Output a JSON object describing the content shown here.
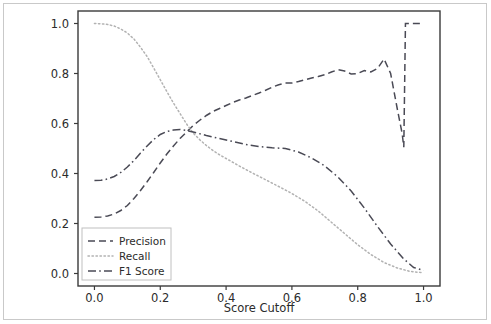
{
  "chart_data": {
    "type": "line",
    "title": "",
    "xlabel": "Score Cutoff",
    "ylabel": "",
    "xlim": [
      -0.05,
      1.05
    ],
    "ylim": [
      -0.05,
      1.05
    ],
    "grid": false,
    "legend_position": "lower left",
    "xticks": [
      0.0,
      0.2,
      0.4,
      0.6,
      0.8,
      1.0
    ],
    "xtick_labels": [
      "0.0",
      "0.2",
      "0.4",
      "0.6",
      "0.8",
      "1.0"
    ],
    "yticks": [
      0.0,
      0.2,
      0.4,
      0.6,
      0.8,
      1.0
    ],
    "ytick_labels": [
      "0.0",
      "0.2",
      "0.4",
      "0.6",
      "0.8",
      "1.0"
    ],
    "series": [
      {
        "name": "Precision",
        "style": "dashed",
        "color": "#4a4a55",
        "x": [
          0.0,
          0.02,
          0.04,
          0.06,
          0.08,
          0.1,
          0.12,
          0.14,
          0.16,
          0.18,
          0.2,
          0.22,
          0.24,
          0.26,
          0.28,
          0.3,
          0.32,
          0.34,
          0.36,
          0.38,
          0.4,
          0.42,
          0.44,
          0.46,
          0.48,
          0.5,
          0.52,
          0.54,
          0.56,
          0.58,
          0.6,
          0.62,
          0.64,
          0.66,
          0.68,
          0.7,
          0.72,
          0.74,
          0.76,
          0.78,
          0.8,
          0.82,
          0.84,
          0.86,
          0.88,
          0.9,
          0.92,
          0.935,
          0.94,
          0.945,
          0.95,
          0.96,
          0.98,
          1.0
        ],
        "y": [
          0.225,
          0.226,
          0.23,
          0.238,
          0.252,
          0.272,
          0.3,
          0.332,
          0.367,
          0.404,
          0.442,
          0.478,
          0.51,
          0.54,
          0.566,
          0.592,
          0.613,
          0.632,
          0.648,
          0.66,
          0.672,
          0.684,
          0.694,
          0.702,
          0.712,
          0.722,
          0.733,
          0.745,
          0.755,
          0.762,
          0.762,
          0.768,
          0.775,
          0.782,
          0.788,
          0.795,
          0.806,
          0.815,
          0.81,
          0.798,
          0.8,
          0.812,
          0.806,
          0.82,
          0.858,
          0.8,
          0.66,
          0.56,
          0.505,
          1.0,
          1.0,
          1.0,
          1.0,
          1.0
        ]
      },
      {
        "name": "Recall",
        "style": "dotted",
        "color": "#b2b2b2",
        "x": [
          0.0,
          0.02,
          0.04,
          0.06,
          0.08,
          0.1,
          0.12,
          0.14,
          0.16,
          0.18,
          0.2,
          0.22,
          0.24,
          0.26,
          0.28,
          0.3,
          0.32,
          0.34,
          0.36,
          0.38,
          0.4,
          0.44,
          0.48,
          0.52,
          0.56,
          0.6,
          0.64,
          0.68,
          0.72,
          0.76,
          0.8,
          0.84,
          0.88,
          0.92,
          0.96,
          1.0
        ],
        "y": [
          1.0,
          0.999,
          0.996,
          0.99,
          0.978,
          0.962,
          0.938,
          0.905,
          0.868,
          0.822,
          0.775,
          0.728,
          0.682,
          0.64,
          0.598,
          0.562,
          0.535,
          0.512,
          0.492,
          0.475,
          0.46,
          0.43,
          0.402,
          0.375,
          0.348,
          0.32,
          0.288,
          0.25,
          0.205,
          0.16,
          0.115,
          0.076,
          0.044,
          0.022,
          0.008,
          0.003
        ]
      },
      {
        "name": "F1 Score",
        "style": "dashdot",
        "color": "#4a4a55",
        "x": [
          0.0,
          0.02,
          0.04,
          0.06,
          0.08,
          0.1,
          0.12,
          0.14,
          0.16,
          0.18,
          0.2,
          0.22,
          0.24,
          0.26,
          0.28,
          0.3,
          0.34,
          0.38,
          0.42,
          0.46,
          0.5,
          0.54,
          0.58,
          0.62,
          0.66,
          0.7,
          0.74,
          0.78,
          0.82,
          0.86,
          0.9,
          0.94,
          0.97,
          1.0
        ],
        "y": [
          0.372,
          0.373,
          0.378,
          0.388,
          0.404,
          0.426,
          0.452,
          0.482,
          0.51,
          0.536,
          0.556,
          0.568,
          0.574,
          0.576,
          0.572,
          0.566,
          0.552,
          0.54,
          0.528,
          0.516,
          0.508,
          0.503,
          0.5,
          0.486,
          0.462,
          0.43,
          0.386,
          0.33,
          0.262,
          0.188,
          0.118,
          0.058,
          0.024,
          0.012
        ]
      }
    ],
    "annotations": {
      "crossover_point": {
        "x": 0.28,
        "y": 0.57
      },
      "precision_peak": {
        "x": 0.88,
        "y": 0.858
      },
      "precision_trough": {
        "x": 0.94,
        "y": 0.505
      }
    }
  },
  "legend": {
    "entries": [
      {
        "label": "Precision",
        "style": "dashed"
      },
      {
        "label": "Recall",
        "style": "dotted"
      },
      {
        "label": "F1 Score",
        "style": "dashdot"
      }
    ]
  },
  "colors": {
    "line_dark": "#4a4a55",
    "line_light": "#b2b2b2",
    "axis": "#3a3a3a",
    "text": "#2b2b2b",
    "figure_border": "#c9c9c9",
    "legend_border": "#c0c0c0",
    "background": "#ffffff"
  }
}
